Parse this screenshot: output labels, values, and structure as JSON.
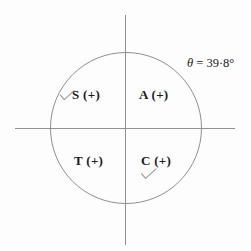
{
  "figure": {
    "background_color": "#fdfdfd",
    "line_color": "#8f8f8f",
    "text_color": "#1b1b1b",
    "pencil_color": "#9a9a9a"
  },
  "annotation": {
    "angle_symbol": "θ",
    "equals": " = ",
    "angle_value": "39·8°",
    "full_text": "θ = 39·8°"
  },
  "quadrants": {
    "second": {
      "label": "S (+)",
      "tick_icon": "check-mark-icon",
      "checked": true
    },
    "first": {
      "label": "A (+)",
      "tick_icon": null,
      "checked": false
    },
    "third": {
      "label": "T (+)",
      "tick_icon": null,
      "checked": false
    },
    "fourth": {
      "label": "C (+)",
      "tick_icon": "check-mark-icon",
      "checked": true
    }
  },
  "geometry": {
    "circle_center_x": 126,
    "circle_center_y": 128,
    "circle_radius": 76
  }
}
